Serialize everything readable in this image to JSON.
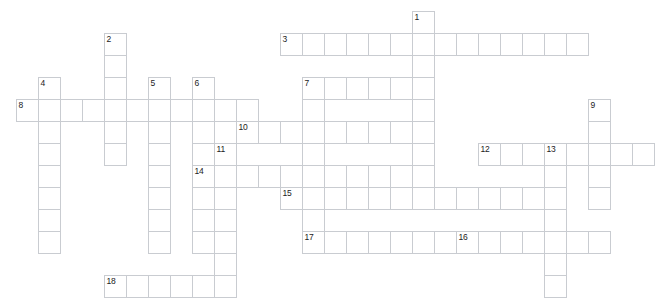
{
  "puzzle": {
    "title": "Crossword Puzzle Grid",
    "cell_size": 22,
    "origin_x": 16,
    "origin_y": 11,
    "grid_color": "#c9ccd1",
    "background_color": "#ffffff",
    "number_color": "#1b1b1b",
    "columns": 29,
    "rows": 13,
    "entries": [
      {
        "number": "1",
        "direction": "down",
        "col": 18,
        "row": 0,
        "length": 7
      },
      {
        "number": "2",
        "direction": "down",
        "col": 4,
        "row": 1,
        "length": 5
      },
      {
        "number": "3",
        "direction": "across",
        "col": 12,
        "row": 1,
        "length": 14
      },
      {
        "number": "4",
        "direction": "down",
        "col": 1,
        "row": 3,
        "length": 7
      },
      {
        "number": "5",
        "direction": "down",
        "col": 6,
        "row": 3,
        "length": 7
      },
      {
        "number": "6",
        "direction": "down",
        "col": 8,
        "row": 3,
        "length": 5
      },
      {
        "number": "7",
        "direction": "down",
        "col": 13,
        "row": 3,
        "length": 8
      },
      {
        "number": "8",
        "direction": "across",
        "col": 0,
        "row": 4,
        "length": 11
      },
      {
        "number": "9",
        "direction": "down",
        "col": 26,
        "row": 4,
        "length": 6
      },
      {
        "number": "10",
        "direction": "across",
        "col": 10,
        "row": 5,
        "length": 9
      },
      {
        "number": "11",
        "direction": "down",
        "col": 9,
        "row": 6,
        "length": 7
      },
      {
        "number": "12",
        "direction": "across",
        "col": 21,
        "row": 6,
        "length": 8
      },
      {
        "number": "13",
        "direction": "down",
        "col": 24,
        "row": 6,
        "length": 7
      },
      {
        "number": "14",
        "direction": "down",
        "col": 8,
        "row": 7,
        "length": 5
      },
      {
        "number": "15",
        "direction": "across",
        "col": 12,
        "row": 8,
        "length": 13
      },
      {
        "number": "16",
        "direction": "across",
        "col": 20,
        "row": 10,
        "length": 7
      },
      {
        "number": "17",
        "direction": "across",
        "col": 13,
        "row": 10,
        "length": 8
      },
      {
        "number": "18",
        "direction": "across",
        "col": 4,
        "row": 12,
        "length": 7
      }
    ],
    "cells": [
      {
        "col": 18,
        "row": 0,
        "num": "1"
      },
      {
        "col": 4,
        "row": 1,
        "num": "2"
      },
      {
        "col": 12,
        "row": 1,
        "num": "3"
      },
      {
        "col": 13,
        "row": 1,
        "num": ""
      },
      {
        "col": 14,
        "row": 1,
        "num": ""
      },
      {
        "col": 15,
        "row": 1,
        "num": ""
      },
      {
        "col": 16,
        "row": 1,
        "num": ""
      },
      {
        "col": 17,
        "row": 1,
        "num": ""
      },
      {
        "col": 18,
        "row": 1,
        "num": ""
      },
      {
        "col": 19,
        "row": 1,
        "num": ""
      },
      {
        "col": 20,
        "row": 1,
        "num": ""
      },
      {
        "col": 21,
        "row": 1,
        "num": ""
      },
      {
        "col": 22,
        "row": 1,
        "num": ""
      },
      {
        "col": 23,
        "row": 1,
        "num": ""
      },
      {
        "col": 24,
        "row": 1,
        "num": ""
      },
      {
        "col": 25,
        "row": 1,
        "num": ""
      },
      {
        "col": 4,
        "row": 2,
        "num": ""
      },
      {
        "col": 18,
        "row": 2,
        "num": ""
      },
      {
        "col": 1,
        "row": 3,
        "num": "4"
      },
      {
        "col": 4,
        "row": 3,
        "num": ""
      },
      {
        "col": 6,
        "row": 3,
        "num": "5"
      },
      {
        "col": 8,
        "row": 3,
        "num": "6"
      },
      {
        "col": 13,
        "row": 3,
        "num": "7"
      },
      {
        "col": 14,
        "row": 3,
        "num": ""
      },
      {
        "col": 15,
        "row": 3,
        "num": ""
      },
      {
        "col": 16,
        "row": 3,
        "num": ""
      },
      {
        "col": 17,
        "row": 3,
        "num": ""
      },
      {
        "col": 18,
        "row": 3,
        "num": ""
      },
      {
        "col": 0,
        "row": 4,
        "num": "8"
      },
      {
        "col": 1,
        "row": 4,
        "num": ""
      },
      {
        "col": 2,
        "row": 4,
        "num": ""
      },
      {
        "col": 3,
        "row": 4,
        "num": ""
      },
      {
        "col": 4,
        "row": 4,
        "num": ""
      },
      {
        "col": 5,
        "row": 4,
        "num": ""
      },
      {
        "col": 6,
        "row": 4,
        "num": ""
      },
      {
        "col": 7,
        "row": 4,
        "num": ""
      },
      {
        "col": 8,
        "row": 4,
        "num": ""
      },
      {
        "col": 9,
        "row": 4,
        "num": ""
      },
      {
        "col": 10,
        "row": 4,
        "num": ""
      },
      {
        "col": 13,
        "row": 4,
        "num": ""
      },
      {
        "col": 18,
        "row": 4,
        "num": ""
      },
      {
        "col": 26,
        "row": 4,
        "num": "9"
      },
      {
        "col": 1,
        "row": 5,
        "num": ""
      },
      {
        "col": 4,
        "row": 5,
        "num": ""
      },
      {
        "col": 6,
        "row": 5,
        "num": ""
      },
      {
        "col": 8,
        "row": 5,
        "num": ""
      },
      {
        "col": 10,
        "row": 5,
        "num": "10"
      },
      {
        "col": 11,
        "row": 5,
        "num": ""
      },
      {
        "col": 12,
        "row": 5,
        "num": ""
      },
      {
        "col": 13,
        "row": 5,
        "num": ""
      },
      {
        "col": 14,
        "row": 5,
        "num": ""
      },
      {
        "col": 15,
        "row": 5,
        "num": ""
      },
      {
        "col": 16,
        "row": 5,
        "num": ""
      },
      {
        "col": 17,
        "row": 5,
        "num": ""
      },
      {
        "col": 18,
        "row": 5,
        "num": ""
      },
      {
        "col": 26,
        "row": 5,
        "num": ""
      },
      {
        "col": 1,
        "row": 6,
        "num": ""
      },
      {
        "col": 4,
        "row": 6,
        "num": ""
      },
      {
        "col": 6,
        "row": 6,
        "num": ""
      },
      {
        "col": 8,
        "row": 6,
        "num": ""
      },
      {
        "col": 9,
        "row": 6,
        "num": "11"
      },
      {
        "col": 13,
        "row": 6,
        "num": ""
      },
      {
        "col": 18,
        "row": 6,
        "num": ""
      },
      {
        "col": 21,
        "row": 6,
        "num": "12"
      },
      {
        "col": 22,
        "row": 6,
        "num": ""
      },
      {
        "col": 23,
        "row": 6,
        "num": ""
      },
      {
        "col": 24,
        "row": 6,
        "num": "13"
      },
      {
        "col": 25,
        "row": 6,
        "num": ""
      },
      {
        "col": 26,
        "row": 6,
        "num": ""
      },
      {
        "col": 27,
        "row": 6,
        "num": ""
      },
      {
        "col": 28,
        "row": 6,
        "num": ""
      },
      {
        "col": 1,
        "row": 7,
        "num": ""
      },
      {
        "col": 6,
        "row": 7,
        "num": ""
      },
      {
        "col": 8,
        "row": 7,
        "num": "14"
      },
      {
        "col": 9,
        "row": 7,
        "num": ""
      },
      {
        "col": 10,
        "row": 7,
        "num": ""
      },
      {
        "col": 11,
        "row": 7,
        "num": ""
      },
      {
        "col": 12,
        "row": 7,
        "num": ""
      },
      {
        "col": 13,
        "row": 7,
        "num": ""
      },
      {
        "col": 14,
        "row": 7,
        "num": ""
      },
      {
        "col": 15,
        "row": 7,
        "num": ""
      },
      {
        "col": 16,
        "row": 7,
        "num": ""
      },
      {
        "col": 17,
        "row": 7,
        "num": ""
      },
      {
        "col": 18,
        "row": 7,
        "num": ""
      },
      {
        "col": 24,
        "row": 7,
        "num": ""
      },
      {
        "col": 26,
        "row": 7,
        "num": ""
      },
      {
        "col": 1,
        "row": 8,
        "num": ""
      },
      {
        "col": 6,
        "row": 8,
        "num": ""
      },
      {
        "col": 8,
        "row": 8,
        "num": ""
      },
      {
        "col": 9,
        "row": 8,
        "num": ""
      },
      {
        "col": 12,
        "row": 8,
        "num": "15"
      },
      {
        "col": 13,
        "row": 8,
        "num": ""
      },
      {
        "col": 14,
        "row": 8,
        "num": ""
      },
      {
        "col": 15,
        "row": 8,
        "num": ""
      },
      {
        "col": 16,
        "row": 8,
        "num": ""
      },
      {
        "col": 17,
        "row": 8,
        "num": ""
      },
      {
        "col": 18,
        "row": 8,
        "num": ""
      },
      {
        "col": 19,
        "row": 8,
        "num": ""
      },
      {
        "col": 20,
        "row": 8,
        "num": ""
      },
      {
        "col": 21,
        "row": 8,
        "num": ""
      },
      {
        "col": 22,
        "row": 8,
        "num": ""
      },
      {
        "col": 23,
        "row": 8,
        "num": ""
      },
      {
        "col": 24,
        "row": 8,
        "num": ""
      },
      {
        "col": 26,
        "row": 8,
        "num": ""
      },
      {
        "col": 1,
        "row": 9,
        "num": ""
      },
      {
        "col": 6,
        "row": 9,
        "num": ""
      },
      {
        "col": 8,
        "row": 9,
        "num": ""
      },
      {
        "col": 9,
        "row": 9,
        "num": ""
      },
      {
        "col": 13,
        "row": 9,
        "num": ""
      },
      {
        "col": 24,
        "row": 9,
        "num": ""
      },
      {
        "col": 1,
        "row": 10,
        "num": ""
      },
      {
        "col": 6,
        "row": 10,
        "num": ""
      },
      {
        "col": 8,
        "row": 10,
        "num": ""
      },
      {
        "col": 9,
        "row": 10,
        "num": ""
      },
      {
        "col": 13,
        "row": 10,
        "num": "17"
      },
      {
        "col": 14,
        "row": 10,
        "num": ""
      },
      {
        "col": 15,
        "row": 10,
        "num": ""
      },
      {
        "col": 16,
        "row": 10,
        "num": ""
      },
      {
        "col": 17,
        "row": 10,
        "num": ""
      },
      {
        "col": 18,
        "row": 10,
        "num": ""
      },
      {
        "col": 19,
        "row": 10,
        "num": ""
      },
      {
        "col": 20,
        "row": 10,
        "num": "16"
      },
      {
        "col": 21,
        "row": 10,
        "num": ""
      },
      {
        "col": 22,
        "row": 10,
        "num": ""
      },
      {
        "col": 23,
        "row": 10,
        "num": ""
      },
      {
        "col": 24,
        "row": 10,
        "num": ""
      },
      {
        "col": 25,
        "row": 10,
        "num": ""
      },
      {
        "col": 26,
        "row": 10,
        "num": ""
      },
      {
        "col": 9,
        "row": 11,
        "num": ""
      },
      {
        "col": 24,
        "row": 11,
        "num": ""
      },
      {
        "col": 4,
        "row": 12,
        "num": "18"
      },
      {
        "col": 5,
        "row": 12,
        "num": ""
      },
      {
        "col": 6,
        "row": 12,
        "num": ""
      },
      {
        "col": 7,
        "row": 12,
        "num": ""
      },
      {
        "col": 8,
        "row": 12,
        "num": ""
      },
      {
        "col": 9,
        "row": 12,
        "num": ""
      },
      {
        "col": 24,
        "row": 12,
        "num": ""
      }
    ]
  }
}
